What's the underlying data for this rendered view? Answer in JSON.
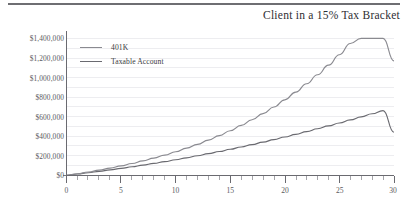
{
  "figure": {
    "title": "Client in a 15% Tax Bracket",
    "top_rule_color": "#6e6e72",
    "background": "#ffffff"
  },
  "legend": {
    "position": "inside-top-left",
    "items": [
      {
        "label": "401K",
        "color": "#8a8a90"
      },
      {
        "label": "Taxable Account",
        "color": "#6a6a70"
      }
    ]
  },
  "axes": {
    "y_tick_labels": [
      "$1,400,000",
      "$1,200,000",
      "$1,000,000",
      "$800,000",
      "$600,000",
      "$400,000",
      "$200,000",
      "$0"
    ],
    "x_tick_labels": [
      "0",
      "5",
      "10",
      "15",
      "20",
      "25",
      "30"
    ],
    "axis_line_color": "#6a6a70",
    "grid_color": "#e4e4e8"
  },
  "chart_data": {
    "type": "line",
    "title": "Client in a 15% Tax Bracket",
    "xlabel": "",
    "ylabel": "",
    "xlim": [
      0,
      30
    ],
    "ylim": [
      0,
      1400000
    ],
    "grid": true,
    "legend_position": "top-left inside plot",
    "x_ticks": [
      0,
      5,
      10,
      15,
      20,
      25,
      30
    ],
    "x_minor_tick_interval": 1,
    "y_ticks": [
      0,
      200000,
      400000,
      600000,
      800000,
      1000000,
      1200000,
      1400000
    ],
    "y_tick_format": "$#,##0",
    "x": [
      0,
      1,
      2,
      3,
      4,
      5,
      6,
      7,
      8,
      9,
      10,
      11,
      12,
      13,
      14,
      15,
      16,
      17,
      18,
      19,
      20,
      21,
      22,
      23,
      24,
      25,
      26,
      27,
      28,
      29,
      30
    ],
    "series": [
      {
        "name": "401K",
        "color": "#8a8a90",
        "values": [
          0,
          16000,
          33500,
          52500,
          73500,
          96000,
          120500,
          147000,
          176000,
          207000,
          241000,
          277500,
          317000,
          360000,
          406000,
          456000,
          510000,
          568000,
          631000,
          699000,
          772000,
          851000,
          936000,
          1028000,
          1126000,
          1233000,
          1348000,
          1472000,
          1606000,
          1750000,
          1170000
        ],
        "end_value": 1170000,
        "note": "upper exponential curve, reaches about $1,170,000 at year 30"
      },
      {
        "name": "Taxable Account",
        "color": "#6a6a70",
        "values": [
          0,
          13000,
          26500,
          40500,
          55500,
          71000,
          87000,
          104000,
          121500,
          140000,
          159000,
          179000,
          199500,
          221000,
          243000,
          266000,
          289500,
          314000,
          339000,
          365000,
          392000,
          419000,
          447000,
          476000,
          505000,
          535000,
          566000,
          597000,
          629000,
          662000,
          440000
        ],
        "end_value": 440000,
        "note": "lower near-linear curve, reaches about $440,000 at year 30"
      }
    ]
  }
}
